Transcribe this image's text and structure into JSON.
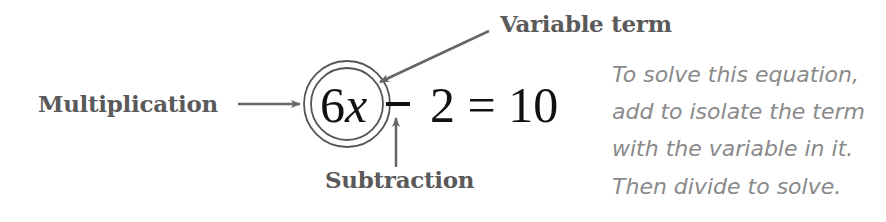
{
  "labels": {
    "multiplication": "Multiplication",
    "subtraction": "Subtraction",
    "variable_term": "Variable term"
  },
  "equation": {
    "variable_term": "6",
    "variable": "x",
    "operator": "−",
    "rest": "2 = 10"
  },
  "note": {
    "lines": [
      "To solve this equation,",
      "add to isolate the term",
      "with the variable in it.",
      "Then divide to solve."
    ]
  },
  "colors": {
    "label": "#5a5a5a",
    "equation": "#111111",
    "note": "#8a8a8a",
    "arrow": "#666666"
  }
}
